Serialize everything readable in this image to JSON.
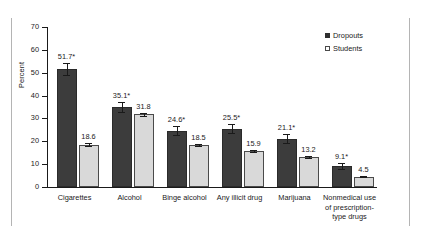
{
  "chart_data": {
    "type": "bar",
    "title": "",
    "subtitle": "",
    "xlabel": "",
    "ylabel": "Percent",
    "ylim": [
      0,
      70
    ],
    "ytick_labels": [
      "70",
      "60",
      "50",
      "40",
      "30",
      "20",
      "10",
      "0"
    ],
    "ytick_values": [
      70,
      60,
      50,
      40,
      30,
      20,
      10,
      0
    ],
    "grid": false,
    "legend_position": "top-right",
    "categories": [
      "Cigarettes",
      "Alcohol",
      "Binge alcohol",
      "Any illicit drug",
      "Marijuana",
      "Nonmedical use of prescription-type drugs"
    ],
    "category_lines": [
      [
        "Cigarettes"
      ],
      [
        "Alcohol"
      ],
      [
        "Binge alcohol"
      ],
      [
        "Any illicit drug"
      ],
      [
        "Marijuana"
      ],
      [
        "Nonmedical use",
        "of prescription-",
        "type drugs"
      ]
    ],
    "series": [
      {
        "name": "Dropouts",
        "color": "#3c3c3c",
        "values": [
          51.7,
          35.1,
          24.6,
          25.5,
          21.1,
          9.1
        ],
        "data_labels": [
          "51.7*",
          "35.1*",
          "24.6*",
          "25.5*",
          "21.1*",
          "9.1*"
        ],
        "error_low": [
          49.0,
          32.8,
          22.6,
          23.5,
          19.2,
          7.9
        ],
        "error_high": [
          54.4,
          37.4,
          26.6,
          27.5,
          23.0,
          10.3
        ]
      },
      {
        "name": "Students",
        "color": "#d9d9d9",
        "values": [
          18.6,
          31.8,
          18.5,
          15.9,
          13.2,
          4.5
        ],
        "data_labels": [
          "18.6",
          "31.8",
          "18.5",
          "15.9",
          "13.2",
          "4.5"
        ],
        "error_low": [
          18.1,
          31.2,
          18.0,
          15.4,
          12.8,
          4.2
        ],
        "error_high": [
          19.1,
          32.4,
          19.0,
          16.4,
          13.6,
          4.8
        ]
      }
    ],
    "annotations": [
      "* indicates statistically significant difference"
    ]
  },
  "legend": {
    "items": [
      {
        "label": "Dropouts"
      },
      {
        "label": "Students"
      }
    ]
  },
  "colors": {
    "dropouts": "#3c3c3c",
    "students": "#d9d9d9",
    "axis": "#1a1a1a",
    "frame": "#b4b4b4"
  }
}
